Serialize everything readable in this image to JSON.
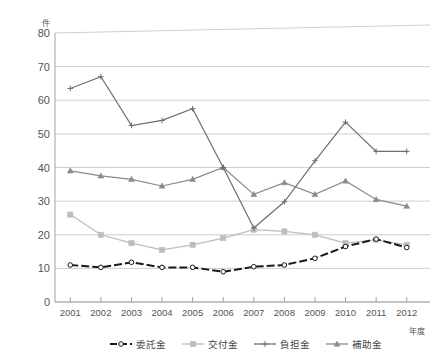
{
  "chart_data": {
    "type": "line",
    "title": "",
    "xlabel": "年度",
    "ylabel": "件",
    "ylim": [
      0,
      80
    ],
    "ytick_step": 10,
    "yticks": [
      "0",
      "10",
      "20",
      "30",
      "40",
      "50",
      "60",
      "70",
      "80"
    ],
    "grid": true,
    "legend_position": "bottom",
    "categories": [
      "2001",
      "2002",
      "2003",
      "2004",
      "2005",
      "2006",
      "2007",
      "2008",
      "2009",
      "2010",
      "2011",
      "2012"
    ],
    "series": [
      {
        "name": "委託金",
        "color": "#1a1a1a",
        "style": "dashed",
        "marker": "circle-open",
        "values": [
          11.0,
          10.3,
          11.8,
          10.3,
          10.3,
          9.0,
          10.5,
          11.0,
          13.0,
          16.5,
          18.7,
          16.2
        ]
      },
      {
        "name": "交付金",
        "color": "#bdbdbd",
        "style": "solid",
        "marker": "square",
        "values": [
          26.0,
          20.0,
          17.5,
          15.5,
          17.0,
          19.0,
          21.5,
          21.0,
          20.0,
          17.5,
          18.5,
          17.0
        ]
      },
      {
        "name": "負担金",
        "color": "#6e6e6e",
        "style": "solid",
        "marker": "plus",
        "values": [
          63.5,
          67.0,
          52.5,
          54.0,
          57.5,
          40.0,
          22.0,
          29.8,
          42.0,
          53.5,
          44.8,
          44.8
        ]
      },
      {
        "name": "補助金",
        "color": "#8a8a8a",
        "style": "solid",
        "marker": "triangle",
        "values": [
          39.0,
          37.5,
          36.5,
          34.5,
          36.5,
          40.0,
          32.0,
          35.5,
          32.0,
          36.0,
          30.5,
          28.5
        ]
      }
    ]
  },
  "legend": {
    "items": [
      {
        "label": "委託金"
      },
      {
        "label": "交付金"
      },
      {
        "label": "負担金"
      },
      {
        "label": "補助金"
      }
    ]
  }
}
